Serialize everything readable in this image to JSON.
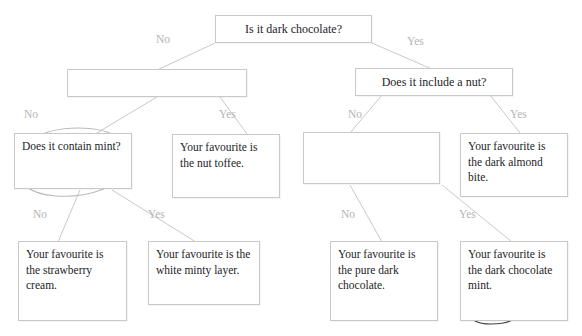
{
  "diagram": {
    "title_fragment": "",
    "type": "decision-tree",
    "line_color": "#c9c9c9",
    "label_color": "#b4b4b4",
    "text_color": "#1d1d1f",
    "annotation_color": "#9aa0a6"
  },
  "nodes": {
    "root": {
      "text": "Is it dark chocolate?"
    },
    "left_mid": {
      "text": ""
    },
    "right_mid": {
      "text": "Does it include a nut?"
    },
    "left_l3_a": {
      "text": "Does it contain mint?"
    },
    "left_l3_b": {
      "text": "Your favourite is the nut toffee."
    },
    "right_l3_a": {
      "text": ""
    },
    "right_l3_b": {
      "text": "Your favourite is the dark almond bite."
    },
    "leaf_1": {
      "text": "Your favourite is the strawberry cream."
    },
    "leaf_2": {
      "text": "Your favourite is the white minty layer."
    },
    "leaf_3": {
      "text": "Your favourite is the pure dark chocolate."
    },
    "leaf_4": {
      "text": "Your favourite is the dark chocolate mint."
    }
  },
  "edge_labels": {
    "root_no": "No",
    "root_yes": "Yes",
    "left_mid_no": "No",
    "left_mid_yes": "Yes",
    "right_mid_no": "No",
    "right_mid_yes": "Yes",
    "left_l3_no": "No",
    "left_l3_yes": "Yes",
    "right_l3_no": "No",
    "right_l3_yes": "Yes"
  },
  "annotations": {
    "circle_mint_question": "hand-drawn oval around 'Does it contain mint?'",
    "circle_pure_dark": "hand-drawn oval around 'pure dark chocolate.'",
    "circle_mint_leaf": "hand-drawn oval around 'mint.'"
  }
}
